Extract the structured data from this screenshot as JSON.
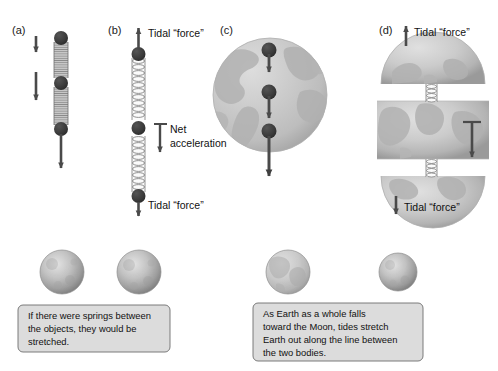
{
  "figure": {
    "background": "#ffffff",
    "width": 498,
    "height": 371
  },
  "colors": {
    "mass_dot": "#3a3a3a",
    "arrow": "#4a4a4a",
    "spring_compressed": "#9a9a9a",
    "spring_stretched": "#8f8f8f",
    "earth_fill": "#c9c9c9",
    "earth_land": "#b0b0b0",
    "moon_fill": "#b5b5b5",
    "caption_fill": "#dcdcdc",
    "caption_border": "#6d6d6d",
    "text": "#111111"
  },
  "panels": [
    {
      "id": "a",
      "label": "(a)",
      "description": "Three masses connected by compressed springs, falling with increasing acceleration",
      "masses": 3,
      "springs": 2,
      "spring_state": "compressed",
      "arrows": [
        {
          "name": "short-acceleration-arrow",
          "direction": "down",
          "length": "short"
        },
        {
          "name": "medium-acceleration-arrow",
          "direction": "down",
          "length": "medium"
        },
        {
          "name": "long-acceleration-arrow",
          "direction": "down",
          "length": "long"
        }
      ],
      "annotations": []
    },
    {
      "id": "b",
      "label": "(b)",
      "description": "Three masses connected by stretched springs showing tidal forces at the ends and net acceleration in the middle",
      "masses": 3,
      "springs": 2,
      "spring_state": "stretched",
      "annotations": [
        {
          "name": "tidal-force-top",
          "text": "Tidal “force”",
          "arrow_direction": "up"
        },
        {
          "name": "net-acceleration",
          "text_line1": "Net",
          "text_line2": "acceleration",
          "arrow_direction": "down"
        },
        {
          "name": "tidal-force-bottom",
          "text": "Tidal “force”",
          "arrow_direction": "down"
        }
      ]
    },
    {
      "id": "c",
      "label": "(c)",
      "description": "Whole Earth with three point masses falling toward the Moon with increasing acceleration",
      "masses": 3,
      "body": "earth",
      "arrows": [
        {
          "name": "short-acceleration-arrow",
          "direction": "down",
          "length": "short"
        },
        {
          "name": "medium-acceleration-arrow",
          "direction": "down",
          "length": "medium"
        },
        {
          "name": "long-acceleration-arrow",
          "direction": "down",
          "length": "long"
        }
      ],
      "annotations": []
    },
    {
      "id": "d",
      "label": "(d)",
      "description": "Earth sliced into three horizontal sections connected by stretched springs, stretched by tidal forces",
      "slices": 3,
      "springs": 2,
      "spring_state": "stretched",
      "body": "earth",
      "annotations": [
        {
          "name": "tidal-force-top",
          "text": "Tidal “force”",
          "arrow_direction": "up"
        },
        {
          "name": "net-acceleration-arrow",
          "text": "",
          "arrow_direction": "down"
        },
        {
          "name": "tidal-force-bottom",
          "text": "Tidal “force”",
          "arrow_direction": "down"
        }
      ]
    }
  ],
  "bodies_row": {
    "left_pair": [
      {
        "name": "moon-sphere-left",
        "type": "moon"
      },
      {
        "name": "moon-sphere-right",
        "type": "moon"
      }
    ],
    "right_pair": [
      {
        "name": "earth-sphere",
        "type": "earth"
      },
      {
        "name": "moon-sphere",
        "type": "moon"
      }
    ]
  },
  "captions": {
    "left": {
      "name": "caption-springs-stretched",
      "lines": [
        "If there were springs between",
        "the objects, they would be",
        "stretched."
      ]
    },
    "right": {
      "name": "caption-earth-tides",
      "lines": [
        "As Earth as a whole falls",
        "toward the Moon, tides stretch",
        "Earth out along the line between",
        "the two bodies."
      ]
    }
  }
}
